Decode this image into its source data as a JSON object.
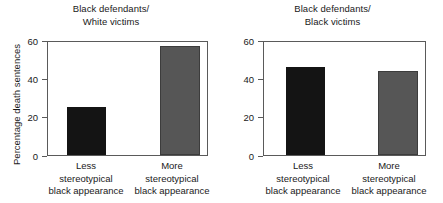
{
  "figure": {
    "ylabel": "Percentage death sentences"
  },
  "chart_data": [
    {
      "type": "bar",
      "title": "Black defendants/\nWhite victims",
      "categories": [
        "Less\nstereotypical\nblack appearance",
        "More\nstereotypical\nblack appearance"
      ],
      "values": [
        25,
        57
      ],
      "xlabel": "",
      "ylabel": "Percentage death sentences",
      "ylim": [
        0,
        60
      ],
      "yticks": [
        0,
        20,
        40,
        60
      ],
      "ytick_labels": [
        "0",
        "20",
        "40",
        "60"
      ],
      "grid": false,
      "legend": "none",
      "bar_colors": [
        "#141414",
        "#565656"
      ]
    },
    {
      "type": "bar",
      "title": "Black defendants/\nBlack victims",
      "categories": [
        "Less\nstereotypical\nblack appearance",
        "More\nstereotypical\nblack appearance"
      ],
      "values": [
        46,
        44
      ],
      "xlabel": "",
      "ylabel": "",
      "ylim": [
        0,
        60
      ],
      "yticks": [
        0,
        20,
        40,
        60
      ],
      "ytick_labels": [
        "0",
        "20",
        "40",
        "60"
      ],
      "grid": false,
      "legend": "none",
      "bar_colors": [
        "#141414",
        "#565656"
      ]
    }
  ]
}
